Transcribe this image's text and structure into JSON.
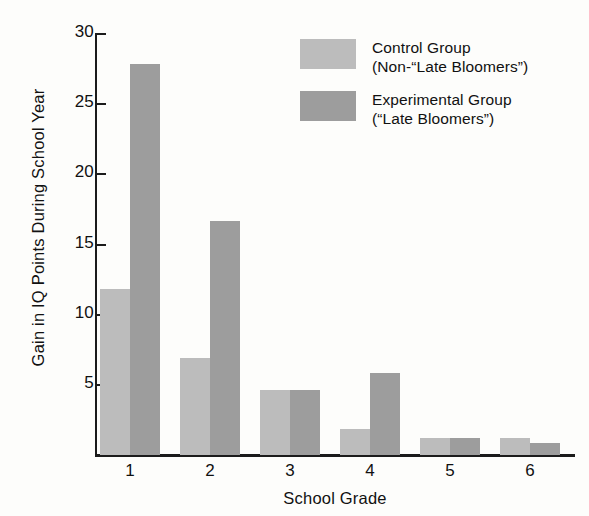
{
  "chart_data": {
    "type": "bar",
    "title": "",
    "xlabel": "School Grade",
    "ylabel": "Gain in IQ Points During School Year",
    "categories": [
      "1",
      "2",
      "3",
      "4",
      "5",
      "6"
    ],
    "ylim": [
      0,
      30
    ],
    "yticks": [
      5,
      10,
      15,
      20,
      25,
      30
    ],
    "grid": false,
    "legend_position": "top-right",
    "series": [
      {
        "name": "Control Group",
        "name_line2": "(Non-‑“Late Bloomers”)",
        "color": "#bcbcbc",
        "values": [
          11.8,
          6.9,
          4.6,
          1.8,
          1.2,
          1.2
        ]
      },
      {
        "name": "Experimental Group",
        "name_line2": "(“Late Bloomers”)",
        "color": "#9d9d9d",
        "values": [
          27.8,
          16.6,
          4.6,
          5.8,
          1.2,
          0.8
        ]
      }
    ]
  },
  "axes": {
    "y_title": "Gain in IQ Points During School Year",
    "x_title": "School Grade",
    "y_tick_labels": [
      "30",
      "25",
      "20",
      "15",
      "10",
      "5"
    ],
    "x_tick_labels": [
      "1",
      "2",
      "3",
      "4",
      "5",
      "6"
    ]
  },
  "legend": {
    "entries": [
      {
        "line1": "Control Group",
        "line2": "(Non‑“Late Bloomers”)",
        "swatch": "#bcbcbc"
      },
      {
        "line1": "Experimental Group",
        "line2": "(“Late Bloomers”)",
        "swatch": "#9d9d9d"
      }
    ]
  }
}
